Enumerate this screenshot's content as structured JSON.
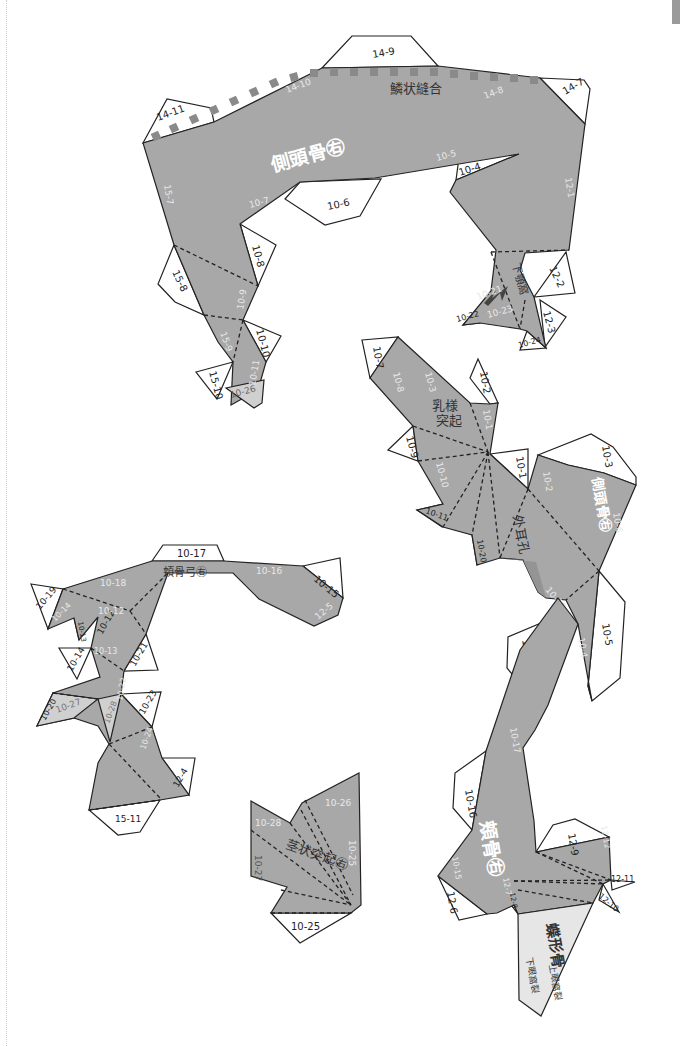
{
  "sheet": {
    "description": "Papercraft skull template – right temporal bone pieces",
    "colors": {
      "piece": "#a8a8a8",
      "flap": "#ffffff",
      "light_piece": "#d0d0d0",
      "suture": "#8a8a8a",
      "outline": "#222222"
    }
  },
  "piece_temporal_squama": {
    "title": "側頭骨㊨",
    "suture_label": "鱗状縫合",
    "arrow_label": "下顎窩",
    "flaps": [
      "14-9",
      "14-11",
      "14-7",
      "10-6",
      "10-4",
      "10-8",
      "15-8",
      "10-10",
      "15-10",
      "12-2",
      "12-3",
      "10-22",
      "10-24"
    ],
    "inner_labels": [
      "14-10",
      "14-8",
      "10-5",
      "10-7",
      "15-7",
      "12-1",
      "10-9",
      "15-9",
      "10-11",
      "10-21",
      "10-23",
      "10-26"
    ]
  },
  "piece_mastoid": {
    "title": "乳様突起",
    "ear_label": "外耳孔",
    "side_title": "側頭骨㊨",
    "flaps": [
      "10-7",
      "10-2",
      "10-9",
      "10-1",
      "10-11",
      "10-20",
      "10-3",
      "10-5",
      "10-18"
    ],
    "inner_labels": [
      "10-8",
      "10-3",
      "10-1",
      "10-10",
      "10-2",
      "10-6",
      "10-19",
      "10-4"
    ]
  },
  "piece_zygomatic": {
    "title": "頬骨弓㊨",
    "flaps": [
      "10-17",
      "10-15",
      "10-19",
      "10-13",
      "10-12",
      "10-14",
      "10-21",
      "10-20",
      "10-23",
      "12-4",
      "15-11"
    ],
    "inner_labels": [
      "10-18",
      "10-16",
      "12-5",
      "10-12",
      "10-14",
      "10-13",
      "10-22",
      "10-27",
      "10-28",
      "10-24"
    ]
  },
  "piece_styloid": {
    "title": "茎状突起㊨",
    "flaps": [
      "10-25"
    ],
    "inner_labels": [
      "10-28",
      "10-26",
      "10-27",
      "10-25"
    ]
  },
  "piece_zygoma": {
    "title": "頬骨㊨",
    "flaps": [
      "10-16",
      "12-9",
      "12-6",
      "12-11",
      "12-10",
      "12-8"
    ],
    "inner_labels": [
      "10-17",
      "10-15",
      "12-12",
      "12-7"
    ]
  },
  "piece_sphenoid": {
    "title": "蝶形骨",
    "label_upper": "上眼窩裂",
    "label_lower": "下眼窩裂"
  }
}
